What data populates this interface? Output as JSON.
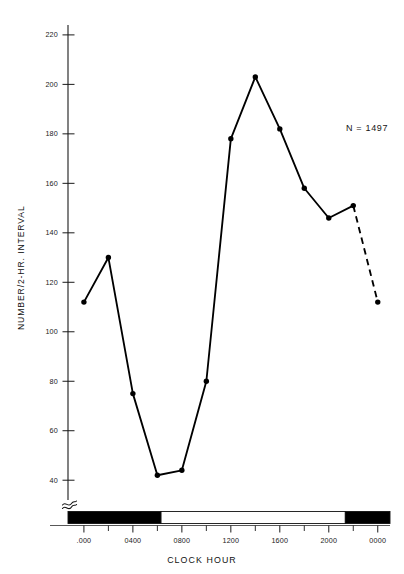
{
  "chart_data": {
    "type": "line",
    "title": "",
    "subtitle": "",
    "xlabel": "CLOCK HOUR",
    "ylabel": "NUMBER/2-HR. INTERVAL",
    "grid": false,
    "legend": "none",
    "annotations": [
      {
        "name": "sample-size",
        "text": "N = 1497",
        "x": 2140,
        "y": 181
      }
    ],
    "axis_break": true,
    "ylim": [
      32,
      224
    ],
    "yticks": [
      40,
      60,
      80,
      100,
      120,
      140,
      160,
      180,
      200,
      220
    ],
    "ytick_labels": [
      "40",
      "60",
      "80",
      "100",
      "120",
      "140",
      "160",
      "180",
      "200",
      "220"
    ],
    "xlim": [
      -130,
      2500
    ],
    "xticks": [
      0,
      400,
      800,
      1200,
      1600,
      2000,
      2400
    ],
    "xtick_labels": [
      ".000",
      "0400",
      "0800",
      "1200",
      "1600",
      "2000",
      "0000"
    ],
    "xminor_ticks": [
      200,
      600,
      1000,
      1400,
      1800,
      2200
    ],
    "x": [
      0,
      200,
      400,
      600,
      800,
      1000,
      1200,
      1400,
      1600,
      1800,
      2000,
      2200,
      2400
    ],
    "x_labels": [
      "0000",
      "0200",
      "0400",
      "0600",
      "0800",
      "1000",
      "1200",
      "1400",
      "1600",
      "1800",
      "2000",
      "2200",
      "0000"
    ],
    "values": [
      112,
      130,
      75,
      42,
      44,
      80,
      178,
      203,
      182,
      158,
      146,
      151,
      112
    ],
    "dashed_from_index": 11,
    "marker": "filled-circle",
    "line_color": "#000000",
    "marker_color": "#000000"
  },
  "daynight_bar": {
    "name": "day-night-bar",
    "segments": [
      {
        "label": "night",
        "from": -130,
        "to": 630,
        "fill": "#000000"
      },
      {
        "label": "day",
        "from": 630,
        "to": 2135,
        "fill": "#ffffff"
      },
      {
        "label": "night",
        "from": 2135,
        "to": 2500,
        "fill": "#000000"
      }
    ]
  },
  "colors": {
    "background": "#ffffff",
    "ink": "#000000",
    "axis": "#1a1a1a",
    "text": "#111111"
  }
}
